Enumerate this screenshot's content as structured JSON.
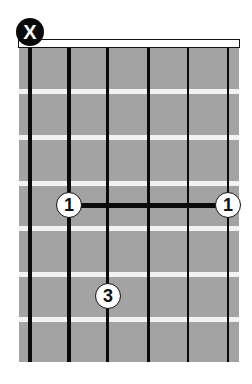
{
  "diagram": {
    "type": "guitar-chord-chart",
    "strings": 6,
    "frets_shown": 7,
    "colors": {
      "fretboard": "#a3a3a3",
      "fret_line": "#f2f2f2",
      "string": "#0a0a0a",
      "marker_fill": "#ffffff",
      "mute_fill": "#0a0a0a"
    },
    "string_states": [
      {
        "string": 6,
        "state": "muted",
        "label": "X"
      },
      {
        "string": 5,
        "state": "fretted"
      },
      {
        "string": 4,
        "state": "fretted"
      },
      {
        "string": 3,
        "state": "fretted"
      },
      {
        "string": 2,
        "state": "fretted"
      },
      {
        "string": 1,
        "state": "fretted"
      }
    ],
    "mute_marker": {
      "label": "X"
    },
    "barre": {
      "fret": 4,
      "from_string": 5,
      "to_string": 1,
      "finger": "1"
    },
    "fingers": [
      {
        "string": 5,
        "fret": 4,
        "label": "1"
      },
      {
        "string": 1,
        "fret": 4,
        "label": "1"
      },
      {
        "string": 4,
        "fret": 6,
        "label": "3"
      }
    ]
  }
}
